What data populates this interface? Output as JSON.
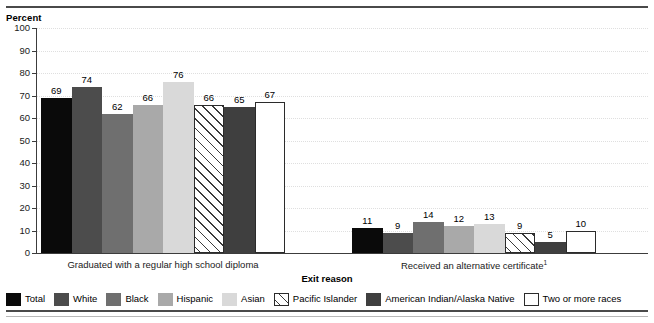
{
  "header": {
    "clipped_caption": "",
    "y_axis_title": "Percent"
  },
  "chart_data": {
    "type": "bar",
    "title": "",
    "xlabel": "Exit reason",
    "ylabel": "Percent",
    "ylim": [
      0,
      100
    ],
    "ytick_step": 10,
    "grid": true,
    "legend_position": "bottom",
    "ytick_labels": [
      "100",
      "90",
      "80",
      "70",
      "60",
      "50",
      "40",
      "30",
      "20",
      "10",
      "0"
    ],
    "categories": [
      "Graduated with a regular high school diploma",
      "Received an alternative certificate"
    ],
    "category_footnotes": [
      "",
      "1"
    ],
    "series": [
      {
        "name": "Total",
        "color": "#0a0a0a",
        "style": "solid",
        "values": [
          69,
          11
        ]
      },
      {
        "name": "White",
        "color": "#4c4c4c",
        "style": "solid",
        "values": [
          74,
          9
        ]
      },
      {
        "name": "Black",
        "color": "#6f6f6f",
        "style": "solid",
        "values": [
          62,
          14
        ]
      },
      {
        "name": "Hispanic",
        "color": "#a9a9a9",
        "style": "solid",
        "values": [
          66,
          12
        ]
      },
      {
        "name": "Asian",
        "color": "#d9d9d9",
        "style": "solid",
        "values": [
          76,
          13
        ]
      },
      {
        "name": "Pacific Islander",
        "color": "#ffffff",
        "style": "hatched",
        "values": [
          66,
          9
        ]
      },
      {
        "name": "American Indian/Alaska Native",
        "color": "#3f3f3f",
        "style": "solid",
        "values": [
          65,
          5
        ]
      },
      {
        "name": "Two or more races",
        "color": "#ffffff",
        "style": "outlined",
        "values": [
          67,
          10
        ]
      }
    ]
  },
  "legend": {
    "items": [
      "Total",
      "White",
      "Black",
      "Hispanic",
      "Asian",
      "Pacific Islander",
      "American Indian/Alaska Native",
      "Two or more races"
    ]
  }
}
